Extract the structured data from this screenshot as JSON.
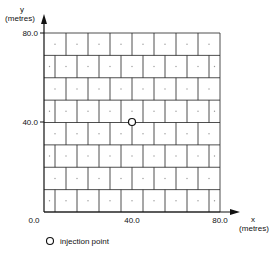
{
  "axes": {
    "y_label": "y",
    "y_unit": "(metres)",
    "x_label": "x",
    "x_unit": "(metres)",
    "y_ticks": [
      "80.0",
      "40.0"
    ],
    "x_ticks": [
      "0.0",
      "40.0",
      "80.0"
    ]
  },
  "grid": {
    "rows": 8,
    "columns": 8,
    "pattern": "brick (alternate rows offset by half a cell)",
    "cell_size_m": 10.0,
    "extent_m": [
      80.0,
      80.0
    ]
  },
  "marker": {
    "name": "injection point",
    "x_m": 40.0,
    "y_m": 40.0,
    "symbol": "open circle"
  },
  "legend": {
    "items": [
      {
        "symbol": "open-circle",
        "label": "injection point"
      }
    ]
  }
}
